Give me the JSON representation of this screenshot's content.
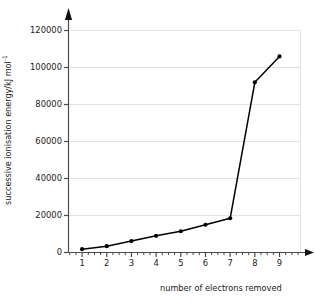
{
  "chart_data": {
    "type": "line",
    "title": "",
    "xlabel": "number of electrons removed",
    "ylabel": "successive ionisation energy/kJ mol",
    "ylabel_unit_exponent": "-1",
    "x": [
      1,
      2,
      3,
      4,
      5,
      6,
      7,
      8,
      9
    ],
    "values": [
      1800,
      3400,
      6200,
      9000,
      11500,
      15000,
      18500,
      92000,
      106000
    ],
    "categories": [
      "1",
      "2",
      "3",
      "4",
      "5",
      "6",
      "7",
      "8",
      "9"
    ],
    "xtick_labels": [
      "1",
      "2",
      "3",
      "4",
      "5",
      "6",
      "7",
      "8",
      "9"
    ],
    "ytick_labels": [
      "0",
      "20000",
      "40000",
      "60000",
      "80000",
      "100000",
      "120000"
    ],
    "ytick_values": [
      0,
      20000,
      40000,
      60000,
      80000,
      100000,
      120000
    ],
    "xlim": [
      0.45,
      9.85
    ],
    "ylim": [
      0,
      130000
    ],
    "grid": "horizontal",
    "legend": "none",
    "marker": "filled-circle",
    "line_color": "#000000",
    "marker_color": "#000000",
    "grid_color": "#e3e3e3",
    "axis_color": "#4d4d4d",
    "background": "#ffffff"
  },
  "axes": {
    "y_axis_name": "successive-ionisation-energy-axis",
    "x_axis_name": "number-of-electrons-removed-axis"
  }
}
